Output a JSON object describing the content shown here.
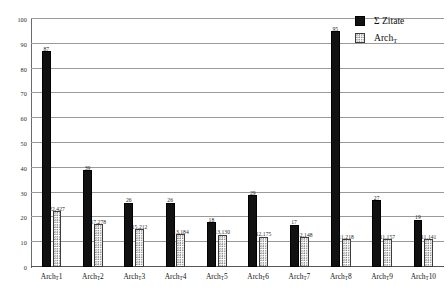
{
  "chart_data": {
    "type": "bar",
    "title": "",
    "xlabel": "",
    "ylabel": "",
    "ylim": [
      0,
      100
    ],
    "yticks": [
      0,
      10,
      20,
      30,
      40,
      50,
      60,
      70,
      80,
      90,
      100
    ],
    "grid": true,
    "legend_position": "top-right",
    "categories": [
      "Archᴛ1",
      "Archᴛ2",
      "Archᴛ3",
      "Archᴛ4",
      "Archᴛ5",
      "Archᴛ6",
      "Archᴛ7",
      "Archᴛ8",
      "Archᴛ9",
      "Archᴛ10"
    ],
    "category_parts": [
      {
        "base": "Arch",
        "sub": "T",
        "index": "1"
      },
      {
        "base": "Arch",
        "sub": "T",
        "index": "2"
      },
      {
        "base": "Arch",
        "sub": "T",
        "index": "3"
      },
      {
        "base": "Arch",
        "sub": "T",
        "index": "4"
      },
      {
        "base": "Arch",
        "sub": "T",
        "index": "5"
      },
      {
        "base": "Arch",
        "sub": "T",
        "index": "6"
      },
      {
        "base": "Arch",
        "sub": "T",
        "index": "7"
      },
      {
        "base": "Arch",
        "sub": "T",
        "index": "8"
      },
      {
        "base": "Arch",
        "sub": "T",
        "index": "9"
      },
      {
        "base": "Arch",
        "sub": "T",
        "index": "10"
      }
    ],
    "series": [
      {
        "name": "Σ Zitate",
        "axis": "left",
        "color": "#111111",
        "style": "solid-black",
        "values": [
          87,
          39,
          26,
          26,
          18,
          29,
          17,
          95,
          27,
          19
        ],
        "labels": [
          "87",
          "39",
          "26",
          "26",
          "18",
          "29",
          "17",
          "95",
          "27",
          "19"
        ]
      },
      {
        "name": "Archᴛ",
        "axis": "right-scaled",
        "color": "#ffffff",
        "style": "dotted-white",
        "values": [
          22427,
          17278,
          15212,
          13184,
          13130,
          12175,
          12148,
          11218,
          11157,
          11141
        ],
        "labels": [
          "22,427",
          "17,278",
          "15,212",
          "13,184",
          "13,130",
          "12,175",
          "12,148",
          "11,218",
          "11,157",
          "11,141"
        ],
        "plotted_heights": [
          22.4,
          17.3,
          15.2,
          13.2,
          13.1,
          12.2,
          12.1,
          11.2,
          11.2,
          11.1
        ]
      }
    ]
  },
  "legend": {
    "items": [
      {
        "label": "Σ Zitate",
        "base": "Σ Zitate",
        "sub": "",
        "swatch": "zitate"
      },
      {
        "label": "Archᴛ",
        "base": "Arch",
        "sub": "T",
        "swatch": "arch"
      }
    ]
  }
}
